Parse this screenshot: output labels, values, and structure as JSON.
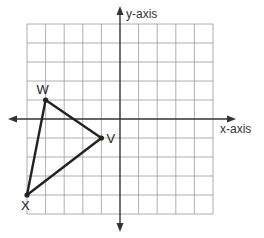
{
  "diagram": {
    "type": "coordinate-plane",
    "axes": {
      "x_label": "x-axis",
      "y_label": "y-axis"
    },
    "grid": {
      "x_range": [
        -5,
        5
      ],
      "y_range": [
        -5,
        5
      ],
      "cell_count_x": 10,
      "cell_count_y": 10
    },
    "triangle": {
      "vertices": [
        {
          "name": "W",
          "x": -4,
          "y": 1
        },
        {
          "name": "V",
          "x": -1,
          "y": -1
        },
        {
          "name": "X",
          "x": -5,
          "y": -4
        }
      ],
      "stroke_color": "#222222"
    },
    "colors": {
      "grid": "#9a9a9a",
      "axis": "#333333",
      "triangle": "#222222"
    }
  }
}
